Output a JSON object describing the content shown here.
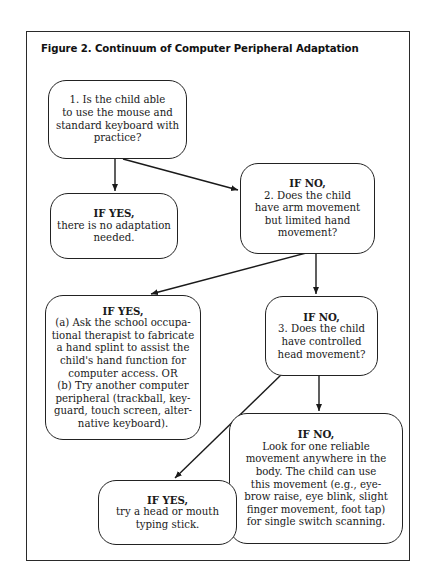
{
  "figure": {
    "title": "Figure 2. Continuum of Computer Peripheral Adaptation"
  },
  "nodes": {
    "q1": {
      "heading": "",
      "lines": [
        "1. Is the child able",
        "to use the mouse and",
        "standard keyboard with",
        "practice?"
      ]
    },
    "yes1": {
      "heading": "IF YES,",
      "lines": [
        "there is no adaptation",
        "needed."
      ]
    },
    "no1_q2": {
      "heading": "IF NO,",
      "lines": [
        "2. Does the child",
        "have arm movement",
        "but limited hand",
        "movement?"
      ]
    },
    "yes2": {
      "heading": "IF YES,",
      "lines": [
        "(a) Ask the school occupa-",
        "tional therapist to fabricate",
        "a hand splint to assist the",
        "child's hand function for",
        "computer access. OR",
        "(b) Try another computer",
        "peripheral (trackball, key-",
        "guard, touch screen, alter-",
        "native keyboard)."
      ]
    },
    "no2_q3": {
      "heading": "IF NO,",
      "lines": [
        "3. Does the child",
        "have controlled",
        "head movement?"
      ]
    },
    "no3": {
      "heading": "IF NO,",
      "lines": [
        "Look for one reliable",
        "movement anywhere in the",
        "body. The child can use",
        "this movement (e.g., eye-",
        "brow raise, eye blink, slight",
        "finger movement, foot tap)",
        "for single switch scanning."
      ]
    },
    "yes3": {
      "heading": "IF YES,",
      "lines": [
        "try a head or mouth",
        "typing stick."
      ]
    }
  },
  "edges": [
    {
      "from": "q1",
      "to": "yes1",
      "label": ""
    },
    {
      "from": "q1",
      "to": "no1_q2",
      "label": ""
    },
    {
      "from": "no1_q2",
      "to": "yes2",
      "label": ""
    },
    {
      "from": "no1_q2",
      "to": "no2_q3",
      "label": ""
    },
    {
      "from": "no2_q3",
      "to": "yes3",
      "label": ""
    },
    {
      "from": "no2_q3",
      "to": "no3",
      "label": ""
    }
  ],
  "colors": {
    "ink": "#1a1a1a",
    "background": "#ffffff"
  }
}
